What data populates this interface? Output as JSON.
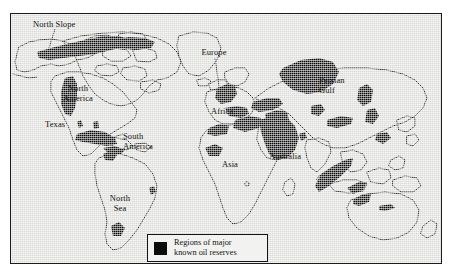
{
  "figure": {
    "kind": "thematic-world-map",
    "title_visible": false,
    "background_color": "#ffffff",
    "map_fill_color": "#d9d9d5",
    "reserve_color": "#0b0b0b",
    "coastline_color": "#1a1a1a",
    "frame_color": "#1a1a1a"
  },
  "legend": {
    "swatch_icon": "filled-square-icon",
    "swatch_color": "#0b0b0b",
    "text": "Regions of major\nknown oil reserves",
    "line1": "Regions of major",
    "line2": "known oil reserves",
    "background_color": "#f2f2f0",
    "border_color": "#151515"
  },
  "labels": [
    {
      "id": "north-slope",
      "text": "North Slope",
      "x": 32,
      "y": 16,
      "leader": true,
      "align": "left"
    },
    {
      "id": "north-america",
      "text": "North\nAmerica",
      "x": 60,
      "y": 79,
      "leader": false,
      "align": "center"
    },
    {
      "id": "texas",
      "text": "Texas",
      "x": 44,
      "y": 114,
      "leader": false,
      "align": "left"
    },
    {
      "id": "gulf-of-mexico",
      "text": "Gulf of\nMexico",
      "x": 120,
      "y": 126,
      "leader": true,
      "align": "left"
    },
    {
      "id": "south-america",
      "text": "South\nAmerica",
      "x": 104,
      "y": 188,
      "leader": false,
      "align": "center"
    },
    {
      "id": "north-sea",
      "text": "North\nSea",
      "x": 196,
      "y": 44,
      "leader": true,
      "align": "center"
    },
    {
      "id": "europe",
      "text": "Europe",
      "x": 210,
      "y": 101,
      "leader": false,
      "align": "left"
    },
    {
      "id": "africa",
      "text": "Africa",
      "x": 221,
      "y": 154,
      "leader": false,
      "align": "left"
    },
    {
      "id": "asia",
      "text": "Asia",
      "x": 318,
      "y": 70,
      "leader": false,
      "align": "left"
    },
    {
      "id": "persian-gulf",
      "text": "Persian\nGulf",
      "x": 266,
      "y": 146,
      "leader": true,
      "align": "left"
    },
    {
      "id": "australia",
      "text": "Australia",
      "x": 355,
      "y": 210,
      "leader": false,
      "align": "left"
    }
  ],
  "reserve_regions": [
    "North Slope (Alaska)",
    "Canadian Arctic",
    "North America (Rocky Mountains)",
    "Texas",
    "Gulf of Mexico",
    "Venezuela (South America)",
    "Brazil coast",
    "North Sea",
    "Europe",
    "North Africa / Libya / Algeria",
    "Nigeria (West Africa)",
    "Persian Gulf",
    "Caspian / Western Siberia",
    "Central Asia",
    "China",
    "Southeast Asia / Indonesia",
    "Australia"
  ]
}
